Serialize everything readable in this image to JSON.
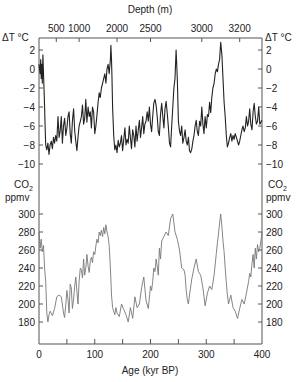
{
  "chart_data": [
    {
      "type": "line",
      "title": "",
      "panel": "temperature",
      "xlabel": "Age (kyr BP)",
      "x_ticks": [
        0,
        100,
        200,
        300,
        400
      ],
      "x_minor_ticks": [
        50,
        150,
        250,
        350
      ],
      "xlim": [
        0,
        400
      ],
      "top_axis": {
        "label": "Depth (m)",
        "ticks": [
          {
            "label": "500",
            "age": 31
          },
          {
            "label": "1000",
            "age": 72
          },
          {
            "label": "2000",
            "age": 140
          },
          {
            "label": "2500",
            "age": 200
          },
          {
            "label": "3000",
            "age": 292
          },
          {
            "label": "3200",
            "age": 360
          }
        ]
      },
      "ylabel": "ΔT °C",
      "y_ticks": [
        2,
        0,
        -2,
        -4,
        -6,
        -8,
        -10
      ],
      "ylim": [
        -10.5,
        3.5
      ],
      "grid": false,
      "series": [
        {
          "name": "ΔT",
          "color": "#222222",
          "x": [
            0,
            2,
            3,
            4,
            5,
            6,
            7,
            8,
            9,
            10,
            11,
            12,
            14,
            16,
            18,
            20,
            22,
            24,
            26,
            28,
            30,
            32,
            34,
            36,
            38,
            40,
            42,
            44,
            46,
            48,
            50,
            52,
            54,
            56,
            58,
            60,
            62,
            64,
            66,
            68,
            70,
            72,
            74,
            76,
            78,
            80,
            82,
            84,
            86,
            88,
            90,
            92,
            94,
            96,
            98,
            100,
            102,
            104,
            106,
            108,
            110,
            112,
            114,
            116,
            118,
            120,
            122,
            124,
            126,
            128,
            129,
            130,
            131,
            132,
            134,
            136,
            138,
            140,
            142,
            144,
            146,
            148,
            150,
            152,
            154,
            156,
            158,
            160,
            162,
            164,
            166,
            168,
            170,
            172,
            174,
            176,
            178,
            180,
            182,
            184,
            186,
            188,
            190,
            192,
            194,
            196,
            198,
            200,
            202,
            204,
            206,
            208,
            210,
            212,
            214,
            216,
            218,
            220,
            222,
            224,
            226,
            228,
            230,
            232,
            234,
            236,
            238,
            240,
            242,
            244,
            246,
            248,
            250,
            252,
            254,
            256,
            258,
            260,
            262,
            264,
            266,
            268,
            270,
            272,
            274,
            276,
            278,
            280,
            282,
            284,
            286,
            288,
            290,
            292,
            294,
            296,
            298,
            300,
            302,
            304,
            306,
            308,
            310,
            312,
            314,
            316,
            318,
            320,
            322,
            324,
            326,
            328,
            330,
            332,
            334,
            336,
            338,
            340,
            342,
            344,
            346,
            348,
            350,
            352,
            354,
            356,
            358,
            360,
            362,
            364,
            366,
            368,
            370,
            372,
            374,
            376,
            378,
            380,
            382,
            384,
            386,
            388,
            390,
            392,
            394,
            396,
            398,
            400
          ],
          "values": [
            0.5,
            -0.5,
            1.0,
            -1.0,
            0.5,
            -1.5,
            1.5,
            -0.5,
            -2.0,
            -4.0,
            -6.0,
            -8.0,
            -8.5,
            -7.8,
            -9.0,
            -8.0,
            -7.6,
            -8.4,
            -7.2,
            -7.8,
            -7.0,
            -7.6,
            -5.0,
            -7.2,
            -6.5,
            -5.0,
            -7.8,
            -6.0,
            -5.2,
            -7.0,
            -6.2,
            -5.0,
            -4.5,
            -6.8,
            -7.8,
            -5.5,
            -4.2,
            -6.5,
            -7.6,
            -8.6,
            -7.2,
            -6.0,
            -5.5,
            -5.0,
            -3.8,
            -5.8,
            -5.2,
            -3.2,
            -5.6,
            -4.0,
            -5.0,
            -4.5,
            -6.2,
            -4.0,
            -4.5,
            -6.8,
            -6.0,
            -4.8,
            -3.5,
            -2.5,
            -3.0,
            -2.0,
            -1.5,
            -1.0,
            -0.5,
            -1.5,
            0.0,
            0.5,
            -0.5,
            1.0,
            2.5,
            1.0,
            -1.0,
            -4.0,
            -7.0,
            -8.5,
            -8.0,
            -8.8,
            -7.5,
            -8.2,
            -7.8,
            -7.0,
            -8.6,
            -7.5,
            -6.2,
            -8.0,
            -7.4,
            -7.8,
            -6.0,
            -7.2,
            -8.4,
            -6.4,
            -7.0,
            -8.2,
            -6.0,
            -7.6,
            -6.5,
            -5.4,
            -7.2,
            -6.2,
            -5.0,
            -6.8,
            -5.8,
            -5.5,
            -4.5,
            -5.5,
            -4.0,
            -5.8,
            -6.6,
            -5.0,
            -3.6,
            -3.2,
            -3.8,
            -5.0,
            -6.6,
            -7.0,
            -4.8,
            -3.6,
            -5.0,
            -6.2,
            -4.2,
            -3.4,
            -4.6,
            -6.0,
            -7.8,
            -8.2,
            -6.0,
            -4.0,
            -2.0,
            -1.0,
            2.0,
            -1.0,
            -5.5,
            -6.5,
            -7.0,
            -6.0,
            -7.8,
            -7.2,
            -6.4,
            -7.6,
            -8.0,
            -7.2,
            -8.6,
            -8.8,
            -8.4,
            -7.6,
            -7.0,
            -6.0,
            -5.4,
            -6.6,
            -7.0,
            -5.5,
            -6.0,
            -4.0,
            -5.8,
            -6.8,
            -5.0,
            -6.2,
            -4.8,
            -5.0,
            -3.5,
            -4.6,
            -3.0,
            -2.0,
            -1.5,
            -0.5,
            0.0,
            -0.3,
            0.5,
            1.0,
            2.8,
            1.5,
            -1.0,
            -3.5,
            -5.0,
            -7.0,
            -8.2,
            -7.8,
            -7.2,
            -6.8,
            -7.6,
            -7.0,
            -7.4,
            -6.8,
            -7.2,
            -7.6,
            -8.0,
            -7.6,
            -7.0,
            -6.4,
            -6.0,
            -6.6,
            -6.2,
            -5.0,
            -6.0,
            -5.5,
            -4.2,
            -5.8,
            -6.4,
            -4.5,
            -3.6,
            -5.0,
            -5.8,
            -5.5,
            -4.0,
            -5.8,
            -5.6,
            -5.4,
            -4.0,
            -2.5,
            -1.5
          ]
        }
      ]
    },
    {
      "type": "line",
      "title": "",
      "panel": "co2",
      "xlabel": "Age (kyr BP)",
      "x_ticks": [
        0,
        100,
        200,
        300,
        400
      ],
      "xlim": [
        0,
        400
      ],
      "ylabel": "CO2 ppmv",
      "y_ticks": [
        300,
        280,
        260,
        240,
        220,
        200,
        180
      ],
      "ylim": [
        165,
        305
      ],
      "grid": false,
      "series": [
        {
          "name": "CO2",
          "color": "#777777",
          "x": [
            0,
            2,
            4,
            6,
            8,
            10,
            12,
            14,
            16,
            18,
            20,
            24,
            28,
            32,
            36,
            40,
            44,
            46,
            48,
            50,
            52,
            54,
            56,
            58,
            60,
            62,
            64,
            66,
            68,
            70,
            72,
            74,
            76,
            78,
            80,
            82,
            84,
            86,
            88,
            90,
            92,
            94,
            96,
            98,
            100,
            102,
            104,
            106,
            108,
            110,
            112,
            114,
            116,
            118,
            120,
            122,
            124,
            126,
            128,
            130,
            132,
            134,
            136,
            138,
            140,
            144,
            148,
            152,
            156,
            160,
            164,
            168,
            172,
            176,
            180,
            184,
            188,
            192,
            196,
            200,
            202,
            204,
            206,
            208,
            210,
            212,
            214,
            216,
            218,
            220,
            224,
            228,
            232,
            236,
            240,
            244,
            248,
            252,
            256,
            260,
            262,
            264,
            266,
            268,
            270,
            274,
            278,
            282,
            286,
            290,
            294,
            298,
            302,
            306,
            310,
            314,
            318,
            320,
            322,
            324,
            326,
            328,
            330,
            332,
            334,
            336,
            338,
            340,
            344,
            348,
            352,
            356,
            360,
            364,
            368,
            372,
            376,
            378,
            380,
            382,
            384,
            386,
            388,
            390,
            392,
            394,
            396,
            398,
            400
          ],
          "values": [
            280,
            262,
            272,
            258,
            265,
            240,
            225,
            190,
            180,
            188,
            192,
            187,
            195,
            208,
            210,
            208,
            190,
            185,
            200,
            215,
            205,
            190,
            222,
            218,
            195,
            205,
            220,
            230,
            214,
            200,
            225,
            240,
            238,
            229,
            250,
            232,
            240,
            255,
            242,
            235,
            248,
            252,
            246,
            258,
            255,
            265,
            272,
            268,
            280,
            276,
            282,
            275,
            285,
            278,
            288,
            280,
            275,
            265,
            240,
            210,
            196,
            192,
            188,
            196,
            190,
            186,
            200,
            194,
            188,
            180,
            196,
            184,
            208,
            196,
            200,
            218,
            230,
            204,
            195,
            220,
            215,
            225,
            240,
            236,
            250,
            242,
            232,
            262,
            250,
            270,
            275,
            280,
            276,
            295,
            300,
            280,
            272,
            260,
            240,
            238,
            232,
            215,
            205,
            200,
            210,
            228,
            240,
            250,
            236,
            232,
            218,
            198,
            212,
            220,
            216,
            232,
            256,
            268,
            278,
            290,
            300,
            286,
            270,
            258,
            240,
            224,
            210,
            200,
            210,
            196,
            192,
            184,
            195,
            205,
            200,
            212,
            225,
            234,
            230,
            245,
            255,
            240,
            262,
            250,
            266,
            258,
            262,
            270,
            280
          ]
        }
      ]
    }
  ],
  "labels": {
    "depth_axis_title": "Depth (m)",
    "age_axis_title": "Age (kyr BP)",
    "temp_unit_left": "ΔT °C",
    "temp_unit_right": "ΔT °C",
    "co2_label_left": "CO",
    "co2_sub_left": "2",
    "co2_unit_left": "ppmv",
    "co2_label_right": "CO",
    "co2_sub_right": "2",
    "co2_unit_right": "ppmv"
  }
}
